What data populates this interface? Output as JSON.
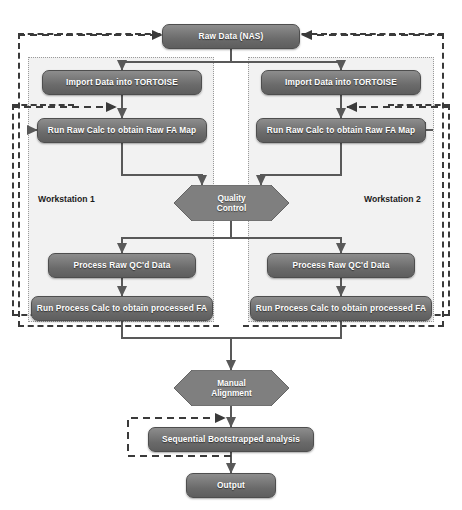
{
  "diagram": {
    "type": "flowchart",
    "colors": {
      "node_fill_top": "#8d8d8d",
      "node_fill_bottom": "#5e5e5e",
      "node_text": "#ffffff",
      "hexagon_fill": "#7f7f7f",
      "region_fill": "#f2f2f2",
      "region_dash_border": "#3a3a3a",
      "region_dot_border": "#9a9a9a",
      "connector": "#595959",
      "background": "#ffffff"
    }
  },
  "nodes": {
    "raw_data": "Raw Data (NAS)",
    "import_left": "Import Data into TORTOISE",
    "import_right": "Import Data into TORTOISE",
    "raw_calc_left": "Run Raw Calc to obtain Raw FA Map",
    "raw_calc_right": "Run Raw Calc to obtain Raw FA Map",
    "quality_control": "Quality\nControl",
    "process_qc_left": "Process Raw QC'd Data",
    "process_qc_right": "Process Raw QC'd Data",
    "process_calc_left": "Run Process Calc to obtain processed FA",
    "process_calc_right": "Run Process Calc to obtain processed FA",
    "manual_alignment": "Manual\nAlignment",
    "bootstrap": "Sequential Bootstrapped analysis",
    "output": "Output"
  },
  "regions": {
    "workstation_1": "Workstation 1",
    "workstation_2": "Workstation 2"
  },
  "flow": {
    "edges": [
      {
        "from": "raw_data",
        "to": "import_left",
        "style": "solid"
      },
      {
        "from": "raw_data",
        "to": "import_right",
        "style": "solid"
      },
      {
        "from": "import_left",
        "to": "raw_calc_left",
        "style": "solid"
      },
      {
        "from": "import_right",
        "to": "raw_calc_right",
        "style": "solid"
      },
      {
        "from": "raw_calc_left",
        "to": "quality_control",
        "style": "solid"
      },
      {
        "from": "raw_calc_right",
        "to": "quality_control",
        "style": "solid"
      },
      {
        "from": "quality_control",
        "to": "process_qc_left",
        "style": "solid"
      },
      {
        "from": "quality_control",
        "to": "process_qc_right",
        "style": "solid"
      },
      {
        "from": "process_qc_left",
        "to": "process_calc_left",
        "style": "solid"
      },
      {
        "from": "process_qc_right",
        "to": "process_calc_right",
        "style": "solid"
      },
      {
        "from": "process_calc_left",
        "to": "manual_alignment",
        "style": "solid"
      },
      {
        "from": "process_calc_right",
        "to": "manual_alignment",
        "style": "solid"
      },
      {
        "from": "manual_alignment",
        "to": "bootstrap",
        "style": "solid"
      },
      {
        "from": "bootstrap",
        "to": "output",
        "style": "solid"
      },
      {
        "from": "workstation_1",
        "to": "raw_data",
        "style": "dashed-feedback"
      },
      {
        "from": "workstation_2",
        "to": "raw_data",
        "style": "dashed-feedback"
      },
      {
        "from": "raw_calc_left",
        "to": "raw_calc_left",
        "style": "dashed-loop"
      },
      {
        "from": "raw_calc_right",
        "to": "raw_calc_right",
        "style": "dashed-loop"
      },
      {
        "from": "bootstrap",
        "to": "bootstrap",
        "style": "dashed-loop"
      }
    ]
  }
}
